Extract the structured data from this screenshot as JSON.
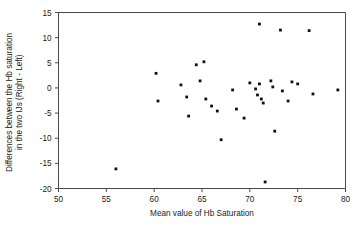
{
  "chart_data": {
    "type": "scatter",
    "title": "",
    "xlabel": "Mean value of Hb Saturation",
    "ylabel": "Differences between the Hb saturation in the two IJs (Right - Left)",
    "ylabel_line1": "Differences between the Hb saturation",
    "ylabel_line2": "in the two IJs (Right - Left)",
    "xlim": [
      50,
      80
    ],
    "ylim": [
      -20,
      15
    ],
    "xticks": [
      50,
      55,
      60,
      65,
      70,
      75,
      80
    ],
    "xtick_labels": [
      "50",
      "55",
      "60",
      "65",
      "70",
      "75",
      "80"
    ],
    "yticks": [
      15,
      10,
      5,
      0,
      -5,
      -10,
      -15,
      -20
    ],
    "ytick_labels": [
      "15",
      "10",
      "5",
      "0",
      "-5",
      "-10",
      "-15",
      "-20"
    ],
    "grid": false,
    "legend": "none",
    "marker": "filled-square",
    "marker_color": "#111111",
    "points": [
      {
        "x": 56.0,
        "y": -16.1
      },
      {
        "x": 60.2,
        "y": 2.9
      },
      {
        "x": 60.4,
        "y": -2.6
      },
      {
        "x": 62.8,
        "y": 0.6
      },
      {
        "x": 63.4,
        "y": -1.8
      },
      {
        "x": 63.6,
        "y": -5.6
      },
      {
        "x": 64.4,
        "y": 4.6
      },
      {
        "x": 64.8,
        "y": 1.4
      },
      {
        "x": 65.2,
        "y": 5.2
      },
      {
        "x": 65.4,
        "y": -2.2
      },
      {
        "x": 66.0,
        "y": -3.6
      },
      {
        "x": 66.6,
        "y": -4.6
      },
      {
        "x": 67.0,
        "y": -10.3
      },
      {
        "x": 68.2,
        "y": -0.4
      },
      {
        "x": 68.6,
        "y": -4.2
      },
      {
        "x": 69.4,
        "y": -6.0
      },
      {
        "x": 70.0,
        "y": 1.0
      },
      {
        "x": 70.6,
        "y": -0.2
      },
      {
        "x": 70.8,
        "y": -1.4
      },
      {
        "x": 71.0,
        "y": 0.8
      },
      {
        "x": 71.0,
        "y": 12.7
      },
      {
        "x": 71.2,
        "y": -2.2
      },
      {
        "x": 71.4,
        "y": -3.0
      },
      {
        "x": 71.6,
        "y": -18.7
      },
      {
        "x": 72.2,
        "y": 1.4
      },
      {
        "x": 72.4,
        "y": 0.2
      },
      {
        "x": 72.6,
        "y": -8.6
      },
      {
        "x": 73.2,
        "y": 11.5
      },
      {
        "x": 73.4,
        "y": -0.6
      },
      {
        "x": 74.0,
        "y": -2.6
      },
      {
        "x": 74.4,
        "y": 1.2
      },
      {
        "x": 75.0,
        "y": 0.8
      },
      {
        "x": 76.2,
        "y": 11.4
      },
      {
        "x": 76.6,
        "y": -1.2
      },
      {
        "x": 79.2,
        "y": -0.4
      }
    ]
  },
  "axes": {
    "x_axis_name": "x-axis",
    "y_axis_name": "y-axis"
  }
}
